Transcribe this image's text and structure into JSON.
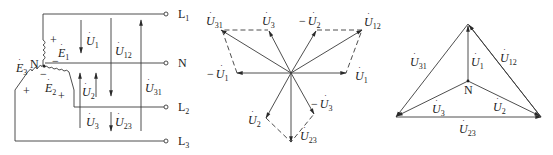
{
  "figure": {
    "panels": [
      {
        "name": "circuit",
        "description": "Three-phase four-wire Y-connected source"
      },
      {
        "name": "phasor-parallelogram",
        "description": "Phase and line voltage phasors by parallelogram construction"
      },
      {
        "name": "phasor-triangle",
        "description": "Line voltage triangle with neutral point"
      }
    ]
  },
  "circuit": {
    "terminals": {
      "L1": "L",
      "L1_sub": "1",
      "N": "N",
      "L2": "L",
      "L2_sub": "2",
      "L3": "L",
      "L3_sub": "3"
    },
    "neutral_label": "N",
    "sources": [
      {
        "symbol": "E",
        "sub": "1",
        "plus": "+",
        "minus": "−"
      },
      {
        "symbol": "E",
        "sub": "2",
        "plus": "+",
        "minus": "−"
      },
      {
        "symbol": "E",
        "sub": "3",
        "plus": "+"
      }
    ],
    "voltages": [
      {
        "symbol": "U",
        "sub": "1"
      },
      {
        "symbol": "U",
        "sub": "12"
      },
      {
        "symbol": "U",
        "sub": "31"
      },
      {
        "symbol": "U",
        "sub": "2"
      },
      {
        "symbol": "U",
        "sub": "3"
      },
      {
        "symbol": "U",
        "sub": "23"
      }
    ]
  },
  "phasor1": {
    "labels": [
      {
        "prefix": "",
        "symbol": "U",
        "sub": "31"
      },
      {
        "prefix": "",
        "symbol": "U",
        "sub": "3"
      },
      {
        "prefix": "−",
        "symbol": "U",
        "sub": "2"
      },
      {
        "prefix": "",
        "symbol": "U",
        "sub": "12"
      },
      {
        "prefix": "−",
        "symbol": "U",
        "sub": "1"
      },
      {
        "prefix": "",
        "symbol": "U",
        "sub": "1"
      },
      {
        "prefix": "",
        "symbol": "U",
        "sub": "2"
      },
      {
        "prefix": "−",
        "symbol": "U",
        "sub": "3"
      },
      {
        "prefix": "",
        "symbol": "U",
        "sub": "23"
      }
    ]
  },
  "phasor2": {
    "neutral_label": "N",
    "labels": [
      {
        "symbol": "U",
        "sub": "31"
      },
      {
        "symbol": "U",
        "sub": "1"
      },
      {
        "symbol": "U",
        "sub": "12"
      },
      {
        "symbol": "U",
        "sub": "3"
      },
      {
        "symbol": "U",
        "sub": "2"
      },
      {
        "symbol": "U",
        "sub": "23"
      }
    ]
  },
  "colors": {
    "stroke": "#3a3a3a",
    "text": "#222222",
    "background": "#ffffff"
  }
}
